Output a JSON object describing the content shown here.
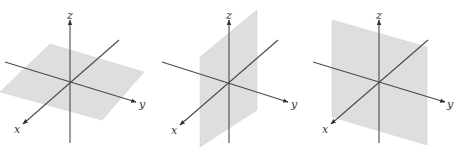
{
  "figure": {
    "panels": [
      {
        "id": "panel-1",
        "description": "plane parallel to xy-plane",
        "labels": {
          "x": "x",
          "y": "y",
          "z": "z"
        }
      },
      {
        "id": "panel-2",
        "description": "vertical plane parallel to xz-plane",
        "labels": {
          "x": "x",
          "y": "y",
          "z": "z"
        }
      },
      {
        "id": "panel-3",
        "description": "vertical plane parallel to yz-plane",
        "labels": {
          "x": "x",
          "y": "y",
          "z": "z"
        }
      }
    ],
    "colors": {
      "plane_fill": "#dedede",
      "axis_stroke": "#4a4a4a"
    }
  }
}
